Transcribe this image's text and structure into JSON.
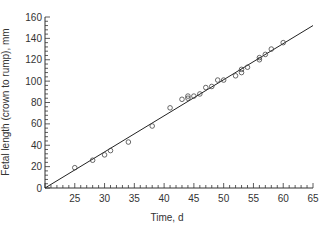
{
  "chart_data": {
    "type": "scatter",
    "title": "",
    "xlabel": "Time, d",
    "ylabel": "Fetal length (crown to rump), mm",
    "xlim": [
      20,
      65
    ],
    "ylim": [
      0,
      160
    ],
    "x_ticks": [
      25,
      30,
      35,
      40,
      45,
      50,
      55,
      60,
      65
    ],
    "y_ticks": [
      0,
      20,
      40,
      60,
      80,
      100,
      120,
      140,
      160
    ],
    "grid": false,
    "legend": null,
    "series": [
      {
        "name": "observations",
        "marker": "open-circle",
        "points": [
          [
            25,
            19
          ],
          [
            28,
            26
          ],
          [
            30,
            31
          ],
          [
            31,
            35
          ],
          [
            34,
            43
          ],
          [
            38,
            58
          ],
          [
            41,
            75
          ],
          [
            43,
            83
          ],
          [
            44,
            84
          ],
          [
            44,
            86
          ],
          [
            45,
            86
          ],
          [
            46,
            88
          ],
          [
            47,
            94
          ],
          [
            48,
            95
          ],
          [
            49,
            101
          ],
          [
            50,
            101
          ],
          [
            52,
            105
          ],
          [
            53,
            108
          ],
          [
            53,
            111
          ],
          [
            54,
            113
          ],
          [
            56,
            120
          ],
          [
            56,
            122
          ],
          [
            57,
            125
          ],
          [
            58,
            130
          ],
          [
            60,
            136
          ]
        ]
      },
      {
        "name": "regression line",
        "marker": "line",
        "points": [
          [
            20,
            0
          ],
          [
            65,
            152
          ]
        ]
      }
    ]
  }
}
